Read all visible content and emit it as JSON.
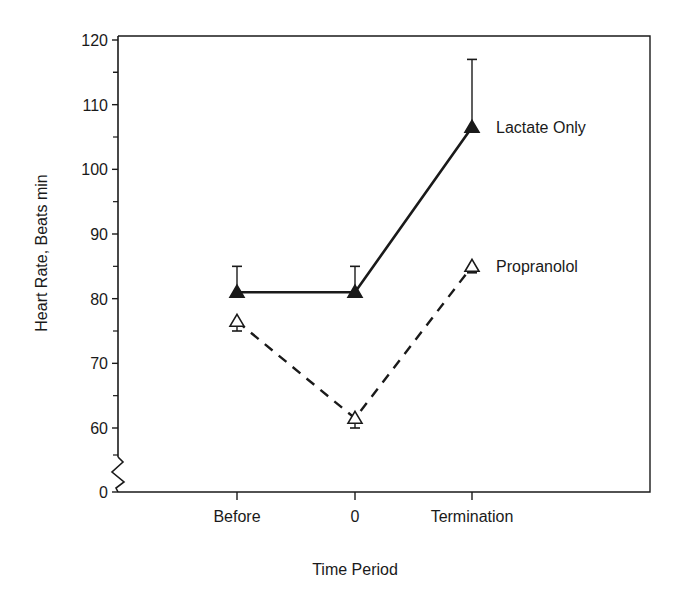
{
  "chart_data": {
    "type": "line",
    "title": "",
    "xlabel": "Time Period",
    "ylabel": "Heart Rate, Beats min",
    "categories": [
      "Before",
      "0",
      "Termination"
    ],
    "yticks": [
      0,
      60,
      70,
      80,
      90,
      100,
      110,
      120
    ],
    "ylim": [
      55,
      120
    ],
    "axis_break": true,
    "grid": false,
    "legend_position": "inline-right",
    "series": [
      {
        "name": "Lactate Only",
        "marker": "filled-triangle",
        "line": "solid",
        "values": [
          81,
          81,
          106.5
        ],
        "error_upper": [
          85,
          85,
          117
        ]
      },
      {
        "name": "Propranolol",
        "marker": "open-triangle",
        "line": "dashed",
        "values": [
          76.5,
          61.5,
          85
        ],
        "error_lower": [
          75,
          60,
          84
        ]
      }
    ]
  },
  "colors": {
    "ink": "#1a1a1a",
    "background": "#ffffff"
  }
}
